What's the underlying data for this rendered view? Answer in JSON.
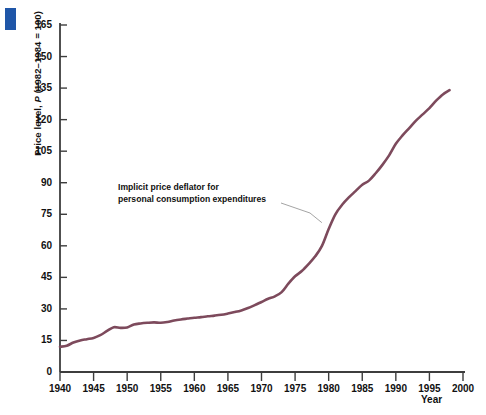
{
  "figure": {
    "corner_marker_color": "#1f56a8",
    "background_color": "#ffffff",
    "axis_color": "#3d3d3d",
    "series_color": "#7d4a5c",
    "leader_line_color": "#9a9a9a"
  },
  "axes": {
    "y_title_prefix": "Price level, ",
    "y_title_italic": "P",
    "y_title_suffix": " (1982–1984 = 100)",
    "y_title_full": "Price level, P (1982–1984 = 100)",
    "x_title": "Year"
  },
  "annotation": {
    "line1": "Implicit price deflator for",
    "line2": "personal consumption expenditures"
  },
  "chart_data": {
    "type": "line",
    "title": "",
    "subtitle": "",
    "xlabel": "Year",
    "ylabel": "Price level, P (1982–1984 = 100)",
    "xlim": [
      1940,
      2000
    ],
    "ylim": [
      0,
      165
    ],
    "grid": false,
    "legend_position": "none",
    "x_ticks": [
      1940,
      1945,
      1950,
      1955,
      1960,
      1965,
      1970,
      1975,
      1980,
      1985,
      1990,
      1995,
      2000
    ],
    "y_ticks": [
      0,
      15,
      30,
      45,
      60,
      75,
      90,
      105,
      120,
      135,
      150,
      165
    ],
    "annotations": [
      {
        "text": "Implicit price deflator for personal consumption expenditures",
        "points_to_x": 1979,
        "points_to_y": 71
      }
    ],
    "series": [
      {
        "name": "Implicit price deflator for personal consumption expenditures",
        "color": "#7d4a5c",
        "x": [
          1940,
          1941,
          1942,
          1943,
          1944,
          1945,
          1946,
          1947,
          1948,
          1949,
          1950,
          1951,
          1952,
          1953,
          1954,
          1955,
          1956,
          1957,
          1958,
          1959,
          1960,
          1961,
          1962,
          1963,
          1964,
          1965,
          1966,
          1967,
          1968,
          1969,
          1970,
          1971,
          1972,
          1973,
          1974,
          1975,
          1976,
          1977,
          1978,
          1979,
          1980,
          1981,
          1982,
          1983,
          1984,
          1985,
          1986,
          1987,
          1988,
          1989,
          1990,
          1991,
          1992,
          1993,
          1994,
          1995,
          1996,
          1997,
          1998
        ],
        "values": [
          12.0,
          12.5,
          14.0,
          15.0,
          15.6,
          16.2,
          17.5,
          19.5,
          21.3,
          21.0,
          21.2,
          22.6,
          23.1,
          23.4,
          23.6,
          23.4,
          23.8,
          24.5,
          25.0,
          25.4,
          25.8,
          26.1,
          26.5,
          26.8,
          27.2,
          27.8,
          28.5,
          29.3,
          30.4,
          31.8,
          33.3,
          34.8,
          36.0,
          38.0,
          42.0,
          45.5,
          48.0,
          51.3,
          55.0,
          60.0,
          68.0,
          75.0,
          79.5,
          83.0,
          86.0,
          89.0,
          91.0,
          94.5,
          98.5,
          103.0,
          108.5,
          112.5,
          116.0,
          119.5,
          122.5,
          125.5,
          129.0,
          132.0,
          134.0
        ],
        "values_indexed_note": "values shown on chart scale; end-of-series ≈ 161"
      }
    ],
    "series_end_value": 161
  }
}
